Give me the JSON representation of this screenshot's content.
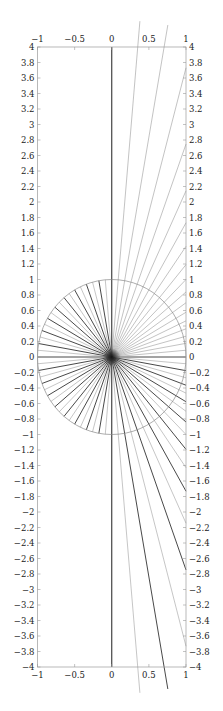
{
  "chart_data": {
    "type": "line",
    "title": "",
    "xlabel": "",
    "ylabel": "",
    "xlim": [
      -1,
      1
    ],
    "ylim": [
      -4,
      4
    ],
    "grid": false,
    "legend": null,
    "x_ticks": [
      -1,
      -0.5,
      0,
      0.5,
      1
    ],
    "x_tick_labels": [
      "−1",
      "−0.5",
      "0",
      "0.5",
      "1"
    ],
    "y_ticks": [
      -4,
      -3.8,
      -3.6,
      -3.4,
      -3.2,
      -3,
      -2.8,
      -2.6,
      -2.4,
      -2.2,
      -2,
      -1.8,
      -1.6,
      -1.4,
      -1.2,
      -1,
      -0.8,
      -0.6,
      -0.4,
      -0.2,
      0,
      0.2,
      0.4,
      0.6,
      0.8,
      1,
      1.2,
      1.4,
      1.6,
      1.8,
      2,
      2.2,
      2.4,
      2.6,
      2.8,
      3,
      3.2,
      3.4,
      3.6,
      3.8,
      4
    ],
    "axes_both_sides": true,
    "unit_circle": {
      "center": [
        0,
        0
      ],
      "radius": 1,
      "color": "#8a8a8a"
    },
    "rays": {
      "origin": [
        0,
        0
      ],
      "angle_step_deg": 5,
      "count": 72,
      "left_half_length": 1,
      "right_half_max_length": 4.35,
      "right_half_clip_x": 1,
      "upper_right_color": "#9a9a9a",
      "dark_color": "#333333",
      "light_color": "#a0a0a0",
      "pattern": "alternating dark/light every 5 deg; left half rays end at unit circle; right half rays extend to x=1 or beyond y=±4; upper-right rays all light"
    },
    "colors": {
      "axis": "#9a9a9a",
      "text": "#222222",
      "background": "#ffffff"
    }
  }
}
